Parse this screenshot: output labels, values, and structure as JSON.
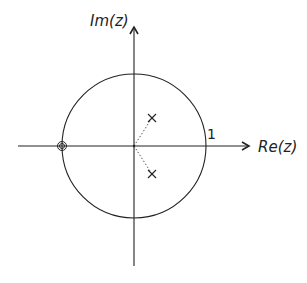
{
  "diagram": {
    "type": "pole-zero plot (z-plane)",
    "axes": {
      "x_label": "Re(z)",
      "y_label": "Im(z)"
    },
    "unit_circle": {
      "label": "1",
      "radius": 1
    },
    "poles": [
      {
        "marker": "x",
        "re": 0.25,
        "im": 0.38
      },
      {
        "marker": "x",
        "re": 0.25,
        "im": -0.38
      }
    ],
    "zeros": [
      {
        "marker": "double-circle",
        "re": -1,
        "im": 0,
        "order": 2
      }
    ],
    "guides": [
      {
        "style": "dotted",
        "from": "origin",
        "to": "pole-upper"
      },
      {
        "style": "dotted",
        "from": "origin",
        "to": "pole-lower"
      }
    ],
    "colors": {
      "line": "#222222",
      "background": "#ffffff"
    }
  }
}
